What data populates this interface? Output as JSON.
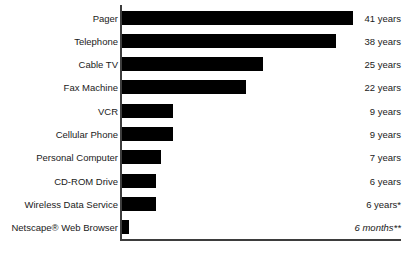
{
  "chart_data": {
    "type": "bar",
    "orientation": "horizontal",
    "title": "",
    "subtitle": "",
    "xlabel": "",
    "ylabel": "",
    "grid": false,
    "legend": null,
    "xlim": [
      0,
      49
    ],
    "unit": "years",
    "categories": [
      "Pager",
      "Telephone",
      "Cable TV",
      "Fax Machine",
      "VCR",
      "Cellular Phone",
      "Personal Computer",
      "CD-ROM Drive",
      "Wireless Data Service",
      "Netscape® Web Browser"
    ],
    "values": [
      41,
      38,
      25,
      22,
      9,
      9,
      7,
      6,
      6,
      0.5
    ],
    "value_labels": [
      "41 years",
      "38 years",
      "25 years",
      "22 years",
      "9 years",
      "9 years",
      "7 years",
      "6 years",
      "6 years*",
      "6 months**"
    ],
    "rows": [
      {
        "label": "Pager",
        "value": 41,
        "value_label": "41 years",
        "italic_unit": false
      },
      {
        "label": "Telephone",
        "value": 38,
        "value_label": "38 years",
        "italic_unit": false
      },
      {
        "label": "Cable TV",
        "value": 25,
        "value_label": "25 years",
        "italic_unit": false
      },
      {
        "label": "Fax Machine",
        "value": 22,
        "value_label": "22 years",
        "italic_unit": false
      },
      {
        "label": "VCR",
        "value": 9,
        "value_label": "9 years",
        "italic_unit": false
      },
      {
        "label": "Cellular Phone",
        "value": 9,
        "value_label": "9 years",
        "italic_unit": false
      },
      {
        "label": "Personal Computer",
        "value": 7,
        "value_label": "7 years",
        "italic_unit": false
      },
      {
        "label": "CD-ROM Drive",
        "value": 6,
        "value_label": "6 years",
        "italic_unit": false
      },
      {
        "label": "Wireless Data Service",
        "value": 6,
        "value_label": "6 years*",
        "italic_unit": false
      },
      {
        "label": "Netscape® Web Browser",
        "value": 0.5,
        "value_label": "6 months**",
        "italic_unit": true
      }
    ],
    "colors": {
      "bar": "#000000",
      "axis": "#3d3d3d",
      "text": "#1a1a1a",
      "background": "#ffffff"
    }
  }
}
